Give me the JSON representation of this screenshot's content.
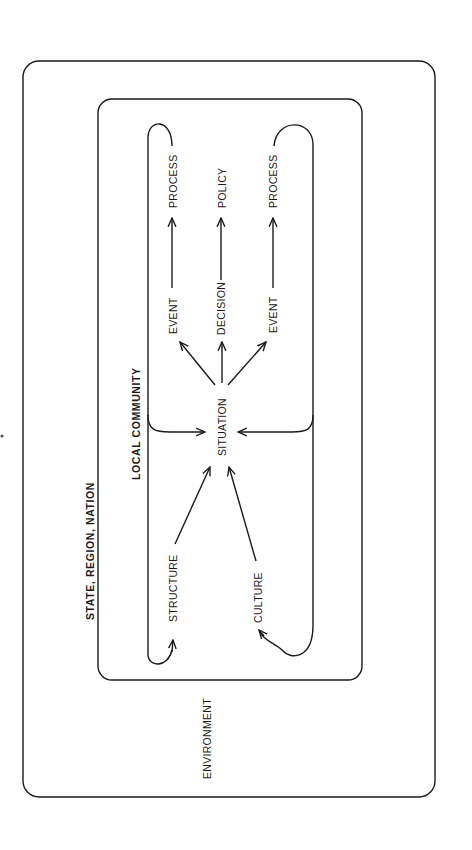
{
  "diagram": {
    "title": "",
    "orientation": "rotated-90-ccw",
    "colors": {
      "ink": "#1a1a1a",
      "background": "#ffffff"
    },
    "containers": {
      "outer": {
        "label": "STATE, REGION, NATION",
        "sublabel": "ENVIRONMENT"
      },
      "inner": {
        "label": "LOCAL COMMUNITY"
      }
    },
    "nodes": {
      "situation": "SITUATION",
      "structure": "STRUCTURE",
      "culture": "CULTURE",
      "event_left": "EVENT",
      "decision": "DECISION",
      "event_right": "EVENT",
      "process_left": "PROCESS",
      "policy": "POLICY",
      "process_right": "PROCESS"
    },
    "edges": [
      {
        "from": "STRUCTURE",
        "to": "SITUATION"
      },
      {
        "from": "CULTURE",
        "to": "SITUATION"
      },
      {
        "from": "SITUATION",
        "to": "EVENT (left)"
      },
      {
        "from": "SITUATION",
        "to": "DECISION"
      },
      {
        "from": "SITUATION",
        "to": "EVENT (right)"
      },
      {
        "from": "EVENT (left)",
        "to": "PROCESS (left)"
      },
      {
        "from": "DECISION",
        "to": "POLICY"
      },
      {
        "from": "EVENT (right)",
        "to": "PROCESS (right)"
      },
      {
        "from": "PROCESS (left)",
        "to": "SITUATION",
        "type": "feedback-loop"
      },
      {
        "from": "PROCESS (right)",
        "to": "SITUATION",
        "type": "feedback-loop"
      },
      {
        "from": "PROCESS (left)",
        "to": "STRUCTURE",
        "type": "feedback-loop"
      },
      {
        "from": "PROCESS (right)",
        "to": "CULTURE",
        "type": "feedback-loop"
      }
    ]
  }
}
